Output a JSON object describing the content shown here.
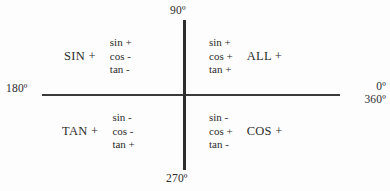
{
  "diagram": {
    "axes": {
      "top_label": "90º",
      "bottom_label": "270º",
      "left_label": "180º",
      "right_label_top": "0º",
      "right_label_bottom": "360º"
    },
    "colors": {
      "background": "#fdfdfd",
      "text": "#2b2b2b",
      "axis": "#3a3a3a"
    },
    "quadrants": [
      {
        "id": "quadrant-1",
        "position": "upper-right",
        "name": "ALL +",
        "sin": "sin +",
        "cos": "cos +",
        "tan": "tan +"
      },
      {
        "id": "quadrant-2",
        "position": "upper-left",
        "name": "SIN +",
        "sin": "sin +",
        "cos": "cos -",
        "tan": "tan -"
      },
      {
        "id": "quadrant-3",
        "position": "lower-left",
        "name": "TAN +",
        "sin": "sin -",
        "cos": "cos -",
        "tan": "tan +"
      },
      {
        "id": "quadrant-4",
        "position": "lower-right",
        "name": "COS +",
        "sin": "sin -",
        "cos": "cos +",
        "tan": "tan -"
      }
    ]
  }
}
